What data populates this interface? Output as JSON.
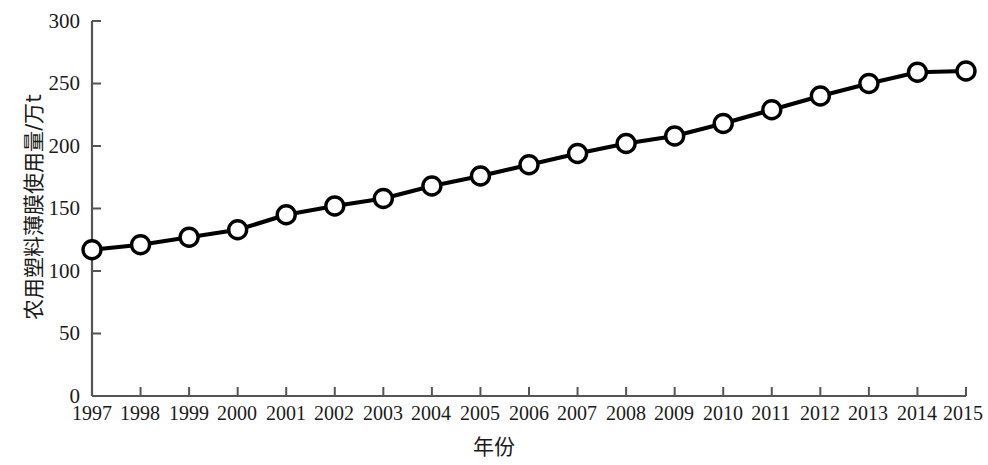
{
  "chart_data": {
    "type": "line",
    "title": "",
    "xlabel": "年份",
    "ylabel": "农用塑料薄膜使用量/万t",
    "categories": [
      "1997",
      "1998",
      "1999",
      "2000",
      "2001",
      "2002",
      "2003",
      "2004",
      "2005",
      "2006",
      "2007",
      "2008",
      "2009",
      "2010",
      "2011",
      "2012",
      "2013",
      "2014",
      "2015"
    ],
    "values": [
      117,
      121,
      127,
      133,
      145,
      152,
      158,
      168,
      176,
      185,
      194,
      202,
      208,
      218,
      229,
      240,
      250,
      259,
      260
    ],
    "x": [
      1997,
      1998,
      1999,
      2000,
      2001,
      2002,
      2003,
      2004,
      2005,
      2006,
      2007,
      2008,
      2009,
      2010,
      2011,
      2012,
      2013,
      2014,
      2015
    ],
    "ylim": [
      0,
      300
    ],
    "xlim": [
      1997,
      2015
    ],
    "yticks": [
      0,
      50,
      100,
      150,
      200,
      250,
      300
    ],
    "ytick_labels": [
      "0",
      "50",
      "100",
      "150",
      "200",
      "250",
      "300"
    ],
    "xtick_labels": [
      "1997",
      "1998",
      "1999",
      "2000",
      "2001",
      "2002",
      "2003",
      "2004",
      "2005",
      "2006",
      "2007",
      "2008",
      "2009",
      "2010",
      "2011",
      "2012",
      "2013",
      "2014",
      "2015"
    ],
    "grid": false,
    "legend": null,
    "legend_position": "none",
    "series": [
      {
        "name": "农用塑料薄膜使用量",
        "values": [
          117,
          121,
          127,
          133,
          145,
          152,
          158,
          168,
          176,
          185,
          194,
          202,
          208,
          218,
          229,
          240,
          250,
          259,
          260
        ],
        "line_color": "#000000",
        "marker": "circle-open",
        "marker_face_color": "#ffffff",
        "marker_edge_color": "#000000"
      }
    ],
    "axis_color": "#555555",
    "tick_direction": "in"
  }
}
